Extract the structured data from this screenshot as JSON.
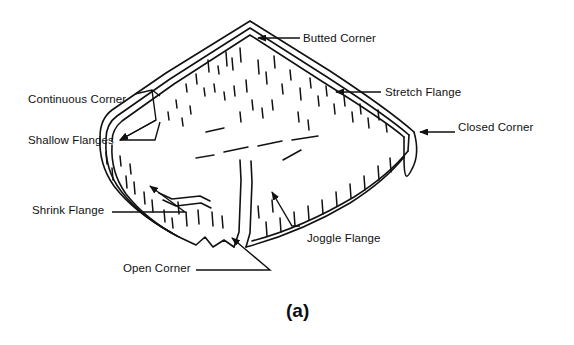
{
  "figure": {
    "caption": "(a)",
    "ink_color": "#111111",
    "background_color": "#ffffff",
    "labels": [
      {
        "id": "continuous-corner-shallow-flanges",
        "line1": "Continuous Corner",
        "line2": "Shallow Flanges",
        "x": 28,
        "y": 66
      },
      {
        "id": "butted-corner",
        "text": "Butted Corner",
        "x": 303,
        "y": 32
      },
      {
        "id": "stretch-flange",
        "text": "Stretch Flange",
        "x": 385,
        "y": 86
      },
      {
        "id": "closed-corner",
        "text": "Closed Corner",
        "x": 458,
        "y": 121
      },
      {
        "id": "shrink-flange",
        "text": "Shrink Flange",
        "x": 32,
        "y": 204
      },
      {
        "id": "open-corner",
        "text": "Open Corner",
        "x": 123,
        "y": 262
      },
      {
        "id": "joggle-flange",
        "text": "Joggle Flange",
        "x": 307,
        "y": 232
      }
    ],
    "caption_position": {
      "x": 286,
      "y": 300
    }
  }
}
